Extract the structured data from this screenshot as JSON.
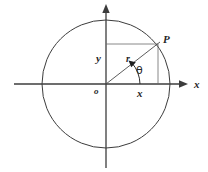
{
  "figure": {
    "type": "geometry-diagram",
    "background_color": "#ffffff",
    "stroke_color": "#3c3c3c",
    "text_color": "#262626",
    "labels": {
      "point_p": "P",
      "radius": "r",
      "angle": "θ",
      "origin": "o",
      "vertical_leg": "y",
      "horizontal_leg": "x",
      "x_axis": "x"
    },
    "geometry": {
      "origin": {
        "x": 106,
        "y": 84
      },
      "circle_radius": 64,
      "point_p": {
        "x": 158,
        "y": 44
      },
      "x_axis": {
        "x1": 14,
        "x2": 188,
        "y": 84
      },
      "y_axis": {
        "y1": 5,
        "y2": 168,
        "x": 106
      }
    }
  }
}
